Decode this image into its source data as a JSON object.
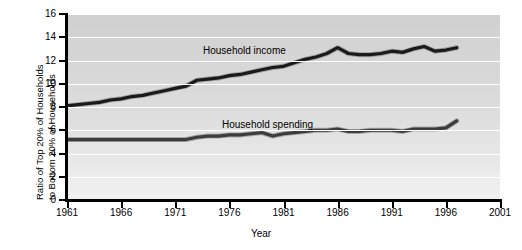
{
  "chart_data": {
    "type": "line",
    "title": "",
    "xlabel": "Year",
    "ylabel_line1": "Ratio of Top 20% of Households",
    "ylabel_line2": "to Bottom 20% of Households",
    "xlim": [
      1961,
      2001
    ],
    "ylim": [
      0,
      16
    ],
    "xticks": [
      1961,
      1966,
      1971,
      1976,
      1981,
      1986,
      1991,
      1996,
      2001
    ],
    "yticks": [
      0,
      2,
      4,
      6,
      8,
      10,
      12,
      14,
      16
    ],
    "grid": "horizontal-white",
    "legend": "inline-labels",
    "series": [
      {
        "name": "Household income",
        "color": "#1a1a1a",
        "x": [
          1961,
          1962,
          1963,
          1964,
          1965,
          1966,
          1967,
          1968,
          1969,
          1970,
          1971,
          1972,
          1973,
          1974,
          1975,
          1976,
          1977,
          1978,
          1979,
          1980,
          1981,
          1982,
          1983,
          1984,
          1985,
          1986,
          1987,
          1988,
          1989,
          1990,
          1991,
          1992,
          1993,
          1994,
          1995,
          1996,
          1997
        ],
        "values": [
          8.1,
          8.2,
          8.3,
          8.4,
          8.6,
          8.7,
          8.9,
          9.0,
          9.2,
          9.4,
          9.6,
          9.8,
          10.3,
          10.4,
          10.5,
          10.7,
          10.8,
          11.0,
          11.2,
          11.4,
          11.5,
          11.8,
          12.1,
          12.3,
          12.6,
          13.1,
          12.6,
          12.5,
          12.5,
          12.6,
          12.8,
          12.7,
          13.0,
          13.2,
          12.8,
          12.9,
          13.1
        ]
      },
      {
        "name": "Household spending",
        "color": "#3c3c3c",
        "x": [
          1961,
          1962,
          1963,
          1964,
          1965,
          1966,
          1967,
          1968,
          1969,
          1970,
          1971,
          1972,
          1973,
          1974,
          1975,
          1976,
          1977,
          1978,
          1979,
          1980,
          1981,
          1982,
          1983,
          1984,
          1985,
          1986,
          1987,
          1988,
          1989,
          1990,
          1991,
          1992,
          1993,
          1994,
          1995,
          1996,
          1997
        ],
        "values": [
          5.2,
          5.2,
          5.2,
          5.2,
          5.2,
          5.2,
          5.2,
          5.2,
          5.2,
          5.2,
          5.2,
          5.2,
          5.4,
          5.5,
          5.5,
          5.6,
          5.6,
          5.7,
          5.8,
          5.5,
          5.7,
          5.8,
          5.9,
          6.0,
          6.0,
          6.1,
          5.9,
          5.9,
          6.0,
          6.0,
          6.0,
          5.9,
          6.1,
          6.1,
          6.1,
          6.2,
          6.8
        ]
      }
    ]
  },
  "axis": {
    "xtick_labels": [
      "1961",
      "1966",
      "1971",
      "1976",
      "1981",
      "1986",
      "1991",
      "1996",
      "2001"
    ],
    "ytick_labels": [
      "0",
      "2",
      "4",
      "6",
      "8",
      "10",
      "12",
      "14",
      "16"
    ],
    "x_title": "Year",
    "y_title_line1": "Ratio of Top 20% of Households",
    "y_title_line2": "to Bottom 20% of Households"
  },
  "labels": {
    "income": "Household income",
    "spending": "Household spending"
  }
}
